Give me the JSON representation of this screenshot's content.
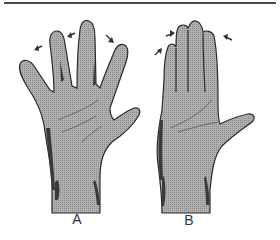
{
  "figure": {
    "panels": [
      {
        "id": "A",
        "label": "A",
        "description": "hand with fingers spread apart, arrows indicating abduction"
      },
      {
        "id": "B",
        "label": "B",
        "description": "hand with fingers held together, arrows indicating adduction"
      }
    ],
    "colors": {
      "skin": "#a8a8a8",
      "outline": "#2a2a2a",
      "shadow": "#3a3a3a",
      "rule": "#4a4a4a",
      "background": "#ffffff"
    },
    "icons": [
      "arrow-icon"
    ]
  }
}
